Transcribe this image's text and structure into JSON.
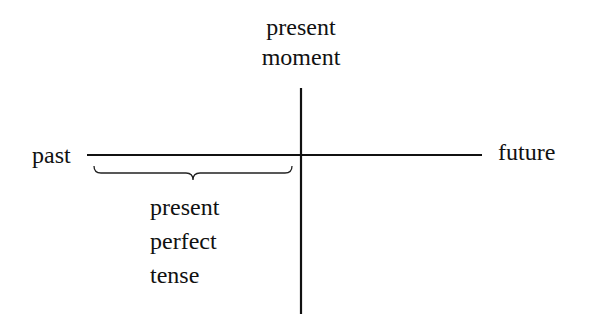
{
  "diagram": {
    "labels": {
      "present_moment": [
        "present",
        "moment"
      ],
      "past": "past",
      "future": "future",
      "present_perfect_tense": [
        "present",
        "perfect",
        "tense"
      ]
    },
    "colors": {
      "line": "#111111",
      "background": "#ffffff"
    },
    "geometry": {
      "time_axis": {
        "x1": 87,
        "x2": 482,
        "y": 155
      },
      "present_axis": {
        "x": 301,
        "y1": 88,
        "y2": 314
      },
      "brace": {
        "x1": 94,
        "x2": 292,
        "y_top": 166,
        "y_bar": 173,
        "tip_y": 180
      }
    }
  }
}
